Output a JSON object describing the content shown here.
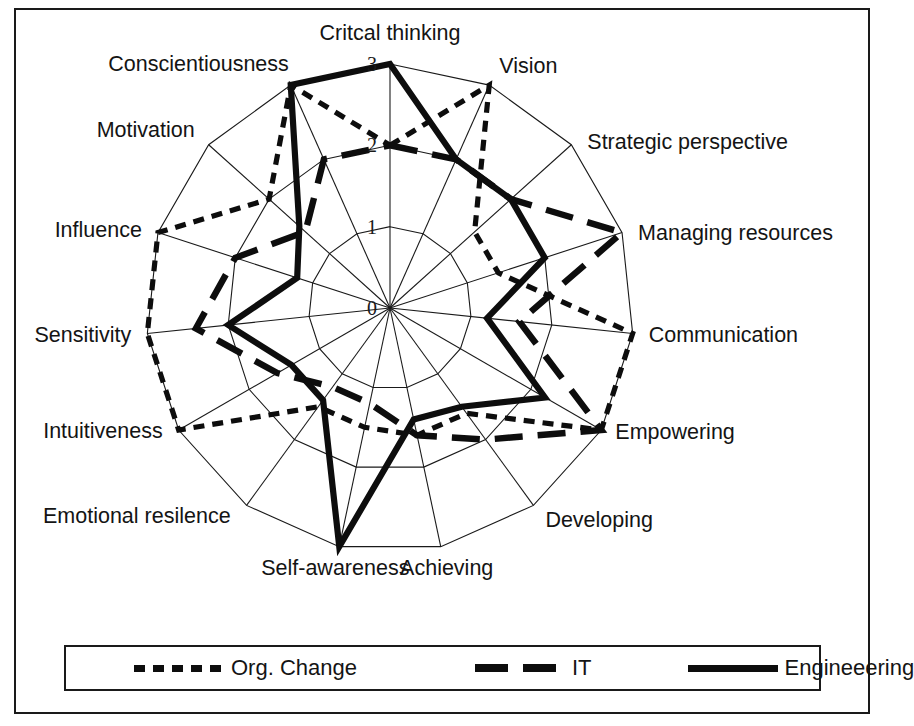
{
  "figure": {
    "background": "#ffffff",
    "ink_color": "#0d0d0d"
  },
  "legend": {
    "position": "bottom",
    "items": [
      {
        "key": "org_change",
        "label": "Org. Change",
        "style": "dotted",
        "swatch": "dotted-line-swatch"
      },
      {
        "key": "it",
        "label": "IT",
        "style": "dashed",
        "swatch": "dashed-line-swatch"
      },
      {
        "key": "engineering",
        "label": "Engineeering",
        "style": "solid",
        "swatch": "solid-line-swatch"
      }
    ]
  },
  "chart_data": {
    "type": "radar",
    "title": "",
    "subtitle": "",
    "xlabel": "",
    "ylabel": "",
    "grid": true,
    "legend_position": "bottom",
    "rlim": [
      0,
      3
    ],
    "r_ticks": [
      "0",
      "1",
      "2",
      "3"
    ],
    "r_tick_values": [
      0,
      1,
      2,
      3
    ],
    "categories": [
      "Critcal thinking",
      "Vision",
      "Strategic perspective",
      "Managing resources",
      "Communication",
      "Empowering",
      "Developing",
      "Achieving",
      "Self-awareness",
      "Emotional resilence",
      "Intuitiveness",
      "Sensitivity",
      "Influence",
      "Motivation",
      "Conscientiousness"
    ],
    "series": [
      {
        "name": "Org. Change",
        "style": "dotted",
        "values": [
          2.0,
          3.0,
          1.4,
          1.4,
          3.0,
          3.0,
          1.6,
          1.6,
          1.5,
          1.5,
          3.0,
          3.0,
          3.0,
          2.0,
          3.0
        ]
      },
      {
        "name": "IT",
        "style": "dashed",
        "values": [
          2.0,
          2.0,
          2.0,
          3.0,
          1.6,
          3.0,
          2.0,
          1.6,
          1.2,
          1.2,
          1.6,
          2.4,
          2.0,
          1.4,
          2.0
        ]
      },
      {
        "name": "Engineeering",
        "style": "solid",
        "values": [
          3.0,
          2.0,
          2.0,
          2.0,
          1.2,
          2.2,
          1.5,
          1.4,
          3.0,
          1.4,
          1.4,
          2.0,
          1.2,
          1.5,
          3.0
        ]
      }
    ]
  }
}
